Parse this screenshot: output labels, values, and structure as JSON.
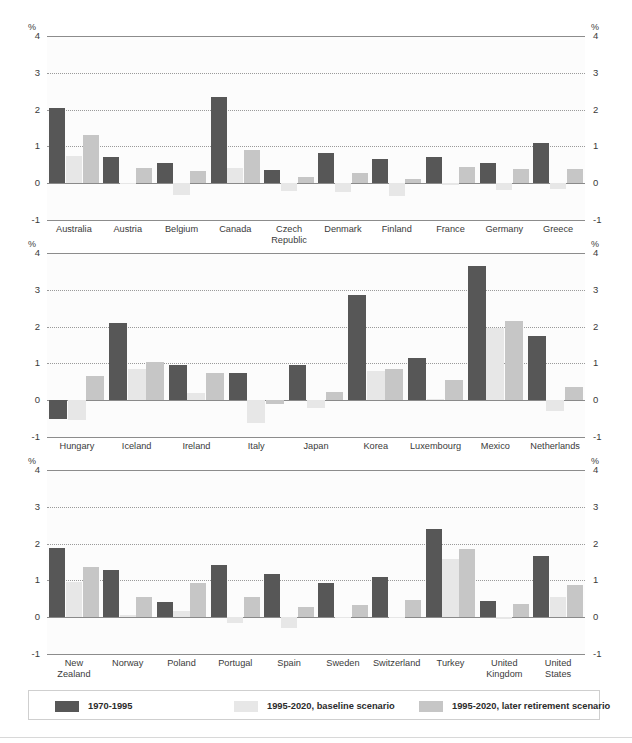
{
  "axis": {
    "unit_symbol": "%",
    "ticks": [
      "4",
      "3",
      "2",
      "1",
      "0",
      "-1"
    ],
    "ymin": -1,
    "ymax": 4
  },
  "legend": {
    "items": [
      {
        "label": "1970-1995",
        "color": "#575757"
      },
      {
        "label": "1995-2020, baseline scenario",
        "color": "#e7e7e7"
      },
      {
        "label": "1995-2020, later retirement scenario",
        "color": "#c6c6c6"
      }
    ]
  },
  "chart_data": {
    "type": "bar",
    "title": "",
    "xlabel": "",
    "ylabel": "%",
    "ylim": [
      -1,
      4
    ],
    "grid": true,
    "legend_position": "bottom",
    "series_names": [
      "1970-1995",
      "1995-2020, baseline scenario",
      "1995-2020, later retirement scenario"
    ],
    "series_colors": [
      "#575757",
      "#e7e7e7",
      "#c6c6c6"
    ],
    "panels": [
      {
        "categories": [
          "Australia",
          "Austria",
          "Belgium",
          "Canada",
          "Czech Republic",
          "Denmark",
          "Finland",
          "France",
          "Germany",
          "Greece"
        ],
        "series": [
          {
            "name": "1970-1995",
            "values": [
              2.05,
              0.72,
              0.55,
              2.35,
              0.35,
              0.83,
              0.65,
              0.71,
              0.55,
              1.1
            ]
          },
          {
            "name": "1995-2020, baseline scenario",
            "values": [
              0.75,
              -0.02,
              -0.33,
              0.4,
              -0.2,
              -0.25,
              -0.35,
              -0.04,
              -0.18,
              -0.15
            ]
          },
          {
            "name": "1995-2020, later retirement scenario",
            "values": [
              1.3,
              0.4,
              0.33,
              0.9,
              0.17,
              0.28,
              0.11,
              0.45,
              0.38,
              0.39
            ]
          }
        ]
      },
      {
        "categories": [
          "Hungary",
          "Iceland",
          "Ireland",
          "Italy",
          "Japan",
          "Korea",
          "Luxembourg",
          "Mexico",
          "Netherlands"
        ],
        "series": [
          {
            "name": "1970-1995",
            "values": [
              -0.5,
              2.1,
              0.97,
              0.75,
              0.95,
              2.85,
              1.15,
              3.65,
              1.75
            ]
          },
          {
            "name": "1995-2020, baseline scenario",
            "values": [
              -0.55,
              0.85,
              0.2,
              -0.62,
              -0.22,
              0.8,
              0.03,
              1.95,
              -0.3
            ]
          },
          {
            "name": "1995-2020, later retirement scenario",
            "values": [
              0.65,
              1.03,
              0.73,
              -0.1,
              0.22,
              0.85,
              0.55,
              2.15,
              0.35
            ]
          }
        ]
      },
      {
        "categories": [
          "New Zealand",
          "Norway",
          "Poland",
          "Portugal",
          "Spain",
          "Sweden",
          "Switzerland",
          "Turkey",
          "United Kingdom",
          "United States"
        ],
        "series": [
          {
            "name": "1970-1995",
            "values": [
              1.87,
              1.28,
              0.4,
              1.43,
              1.17,
              0.93,
              1.1,
              2.4,
              0.45,
              1.65
            ]
          },
          {
            "name": "1995-2020, baseline scenario",
            "values": [
              0.95,
              0.05,
              0.18,
              -0.17,
              -0.3,
              0.0,
              -0.02,
              1.58,
              -0.05,
              0.55
            ]
          },
          {
            "name": "1995-2020, later retirement scenario",
            "values": [
              1.37,
              0.55,
              0.92,
              0.55,
              0.27,
              0.33,
              0.47,
              1.85,
              0.37,
              0.88
            ]
          }
        ]
      }
    ]
  }
}
